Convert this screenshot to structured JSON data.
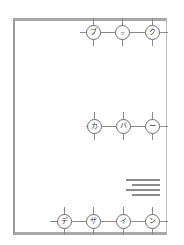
{
  "title": {
    "rows": [
      {
        "id": "top",
        "chars": [
          "ブ",
          "ッ",
          "ク"
        ]
      },
      {
        "id": "middle",
        "chars": [
          "カ",
          "バ",
          "ー"
        ]
      },
      {
        "id": "bottom",
        "chars": [
          "デ",
          "ザ",
          "イ",
          "ン"
        ]
      }
    ],
    "full_text": "ブックカバーデザイン"
  },
  "colors": {
    "frame": "#a8a8a8",
    "line": "#8a8a8a",
    "node_border": "#6e6e6e",
    "background": "#ffffff"
  }
}
